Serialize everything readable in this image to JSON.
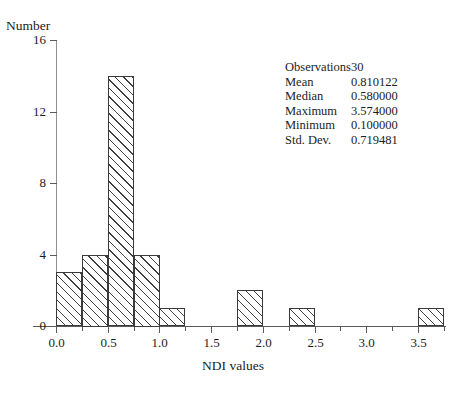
{
  "chart_data": {
    "type": "bar",
    "title": "",
    "xlabel": "NDI values",
    "ylabel": "Number",
    "xlim": [
      0.0,
      3.75
    ],
    "ylim": [
      0,
      16
    ],
    "bin_width": 0.25,
    "grid": false,
    "x_ticks": [
      "0.0",
      "0.5",
      "1.0",
      "1.5",
      "2.0",
      "2.5",
      "3.0",
      "3.5"
    ],
    "x_tick_values": [
      0.0,
      0.5,
      1.0,
      1.5,
      2.0,
      2.5,
      3.0,
      3.5
    ],
    "y_ticks": [
      "0",
      "4",
      "8",
      "12",
      "16"
    ],
    "y_tick_values": [
      0,
      4,
      8,
      12,
      16
    ],
    "bins": [
      {
        "x0": 0.0,
        "x1": 0.25,
        "count": 3
      },
      {
        "x0": 0.25,
        "x1": 0.5,
        "count": 4
      },
      {
        "x0": 0.5,
        "x1": 0.75,
        "count": 14
      },
      {
        "x0": 0.75,
        "x1": 1.0,
        "count": 4
      },
      {
        "x0": 1.0,
        "x1": 1.25,
        "count": 1
      },
      {
        "x0": 1.25,
        "x1": 1.5,
        "count": 0
      },
      {
        "x0": 1.5,
        "x1": 1.75,
        "count": 0
      },
      {
        "x0": 1.75,
        "x1": 2.0,
        "count": 2
      },
      {
        "x0": 2.0,
        "x1": 2.25,
        "count": 0
      },
      {
        "x0": 2.25,
        "x1": 2.5,
        "count": 1
      },
      {
        "x0": 2.5,
        "x1": 2.75,
        "count": 0
      },
      {
        "x0": 2.75,
        "x1": 3.0,
        "count": 0
      },
      {
        "x0": 3.0,
        "x1": 3.25,
        "count": 0
      },
      {
        "x0": 3.25,
        "x1": 3.5,
        "count": 0
      },
      {
        "x0": 3.5,
        "x1": 3.75,
        "count": 1
      }
    ],
    "categories": [
      "0.00-0.25",
      "0.25-0.50",
      "0.50-0.75",
      "0.75-1.00",
      "1.00-1.25",
      "1.25-1.50",
      "1.50-1.75",
      "1.75-2.00",
      "2.00-2.25",
      "2.25-2.50",
      "2.50-2.75",
      "2.75-3.00",
      "3.00-3.25",
      "3.25-3.50",
      "3.50-3.75"
    ],
    "values": [
      3,
      4,
      14,
      4,
      1,
      0,
      0,
      2,
      0,
      1,
      0,
      0,
      0,
      0,
      1
    ],
    "legend_position": "none",
    "bar_style": {
      "fill": "#ffffff",
      "edge": "#3a3a3a",
      "hatch": "diagonal-up-right"
    }
  },
  "stats": {
    "rows": [
      {
        "name": "Observations",
        "value": "30",
        "align": "left"
      },
      {
        "name": "Mean",
        "value": "0.810122",
        "align": "right"
      },
      {
        "name": "Median",
        "value": "0.580000",
        "align": "right"
      },
      {
        "name": "Maximum",
        "value": "3.574000",
        "align": "right"
      },
      {
        "name": "Minimum",
        "value": "0.100000",
        "align": "right"
      },
      {
        "name": "Std. Dev.",
        "value": "0.719481",
        "align": "right"
      }
    ]
  }
}
